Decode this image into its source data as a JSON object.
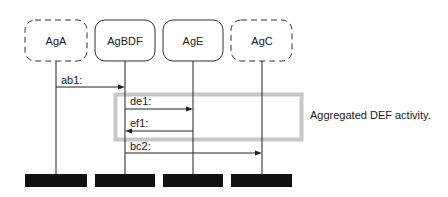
{
  "diagram": {
    "type": "sequence",
    "agents": [
      {
        "id": "AgA",
        "label": "AgA",
        "style": "dashed"
      },
      {
        "id": "AgBDF",
        "label": "AgBDF",
        "style": "solid"
      },
      {
        "id": "AgE",
        "label": "AgE",
        "style": "solid"
      },
      {
        "id": "AgC",
        "label": "AgC",
        "style": "dashed"
      }
    ],
    "messages": [
      {
        "label": "ab1:",
        "from": "AgA",
        "to": "AgBDF"
      },
      {
        "label": "de1:",
        "from": "AgBDF",
        "to": "AgE"
      },
      {
        "label": "ef1:",
        "from": "AgE",
        "to": "AgBDF"
      },
      {
        "label": "bc2:",
        "from": "AgBDF",
        "to": "AgC"
      }
    ],
    "highlight": {
      "label": "Aggregated DEF activity.",
      "covers": [
        "de1:",
        "ef1:"
      ],
      "color": "#c8c8c8"
    },
    "colors": {
      "line": "#1a1a1a",
      "terminator": "#111111",
      "highlight": "#c8c8c8"
    }
  }
}
